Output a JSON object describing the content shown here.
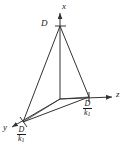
{
  "figure": {
    "type": "3d-axes-plane-diagram",
    "line_color": "#333333",
    "text_color": "#1a1a1a",
    "background": "#ffffff",
    "axes": [
      {
        "id": "x",
        "label": "x",
        "direction": "up",
        "label_x": 62,
        "label_y": 2
      },
      {
        "id": "z",
        "label": "z",
        "direction": "right",
        "label_x": 116,
        "label_y": 92
      },
      {
        "id": "y",
        "label": "y",
        "direction": "down-left",
        "label_x": 3,
        "label_y": 124
      }
    ],
    "intercepts": [
      {
        "axis": "x",
        "label_text": "D",
        "kind": "plain",
        "point_x": 60,
        "point_y": 26,
        "label_x": 41,
        "label_y": 19
      },
      {
        "axis": "z",
        "label_text": "D/k1",
        "kind": "fraction",
        "numerator": "D",
        "denominator": "k",
        "denominator_sub": "1",
        "point_x": 89,
        "point_y": 97,
        "label_x": 83,
        "label_y": 100
      },
      {
        "axis": "y",
        "label_text": "D/k1",
        "kind": "fraction",
        "numerator": "D",
        "denominator": "k",
        "denominator_sub": "1",
        "point_x": 23,
        "point_y": 122,
        "label_x": 17,
        "label_y": 127
      }
    ],
    "origin": {
      "x": 60,
      "y": 99
    }
  }
}
